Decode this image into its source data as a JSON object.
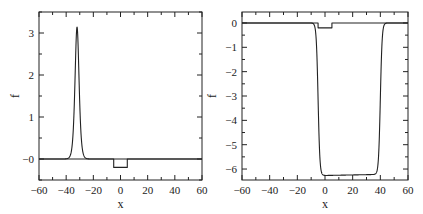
{
  "chart_data": [
    {
      "type": "line",
      "title": "",
      "xlabel": "x",
      "ylabel": "f",
      "xlim": [
        -60,
        60
      ],
      "ylim": [
        -0.5,
        3.5
      ],
      "xticks": [
        -60,
        -40,
        -20,
        0,
        20,
        40,
        60
      ],
      "xtick_labels": [
        "−60",
        "−40",
        "−20",
        "0",
        "20",
        "40",
        "60"
      ],
      "xminor_step": 10,
      "yticks": [
        0,
        1,
        2,
        3
      ],
      "ytick_labels": [
        "−0",
        "1",
        "2",
        "3"
      ],
      "yminor_step": 0.5,
      "grid": false,
      "legend": null,
      "series": [
        {
          "name": "soliton",
          "shape": "sech2 pulse",
          "peak_x": -32,
          "peak_y": 3.14,
          "width": 2.0
        },
        {
          "name": "potential well",
          "shape": "rectangle",
          "x": [
            -60,
            -5,
            -5,
            5,
            5,
            60
          ],
          "y": [
            0,
            0,
            -0.2,
            -0.2,
            0,
            0
          ]
        }
      ],
      "frame": {
        "left": 39,
        "right": 202,
        "top": 12,
        "bottom": 180
      }
    },
    {
      "type": "line",
      "title": "",
      "xlabel": "x",
      "ylabel": "f",
      "xlim": [
        -60,
        60
      ],
      "ylim": [
        -6.45,
        0.45
      ],
      "xticks": [
        -60,
        -40,
        -20,
        0,
        20,
        40,
        60
      ],
      "xtick_labels": [
        "−60",
        "−40",
        "−20",
        "0",
        "20",
        "40",
        "60"
      ],
      "xminor_step": 10,
      "yticks": [
        0,
        -1,
        -2,
        -3,
        -4,
        -5,
        -6
      ],
      "ytick_labels": [
        "0",
        "−1",
        "−2",
        "−3",
        "−4",
        "−5",
        "−6"
      ],
      "yminor_step": 0.5,
      "grid": false,
      "legend": null,
      "series": [
        {
          "name": "dark trough",
          "shape": "flat-bottom well",
          "left_edge_x": -5,
          "right_edge_x": 40,
          "bottom_y_left": -6.27,
          "bottom_y_right": -6.22,
          "edge_width": 1.3
        },
        {
          "name": "potential well",
          "shape": "rectangle",
          "x": [
            -60,
            -5,
            -5,
            5,
            5,
            60
          ],
          "y": [
            0,
            0,
            -0.2,
            -0.2,
            0,
            0
          ]
        }
      ],
      "frame": {
        "left": 242,
        "right": 408,
        "top": 12,
        "bottom": 180
      }
    }
  ]
}
